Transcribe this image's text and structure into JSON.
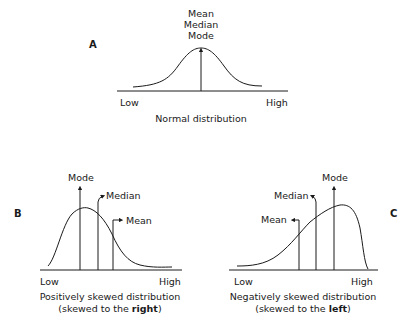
{
  "panels": {
    "a": {
      "letter": "A",
      "stat_labels": [
        "Mean",
        "Median",
        "Mode"
      ],
      "axis_low": "Low",
      "axis_high": "High",
      "caption": "Normal distribution"
    },
    "b": {
      "letter": "B",
      "mode_label": "Mode",
      "median_label": "Median",
      "mean_label": "Mean",
      "axis_low": "Low",
      "axis_high": "High",
      "caption_line1": "Positively skewed distribution",
      "caption_line2_prefix": "(skewed to the ",
      "caption_line2_bold": "right",
      "caption_line2_suffix": ")"
    },
    "c": {
      "letter": "C",
      "mode_label": "Mode",
      "median_label": "Median",
      "mean_label": "Mean",
      "axis_low": "Low",
      "axis_high": "High",
      "caption_line1": "Negatively skewed distribution",
      "caption_line2_prefix": "(skewed to the ",
      "caption_line2_bold": "left",
      "caption_line2_suffix": ")"
    }
  },
  "colors": {
    "stroke": "#1a1a1a",
    "background": "#ffffff"
  }
}
